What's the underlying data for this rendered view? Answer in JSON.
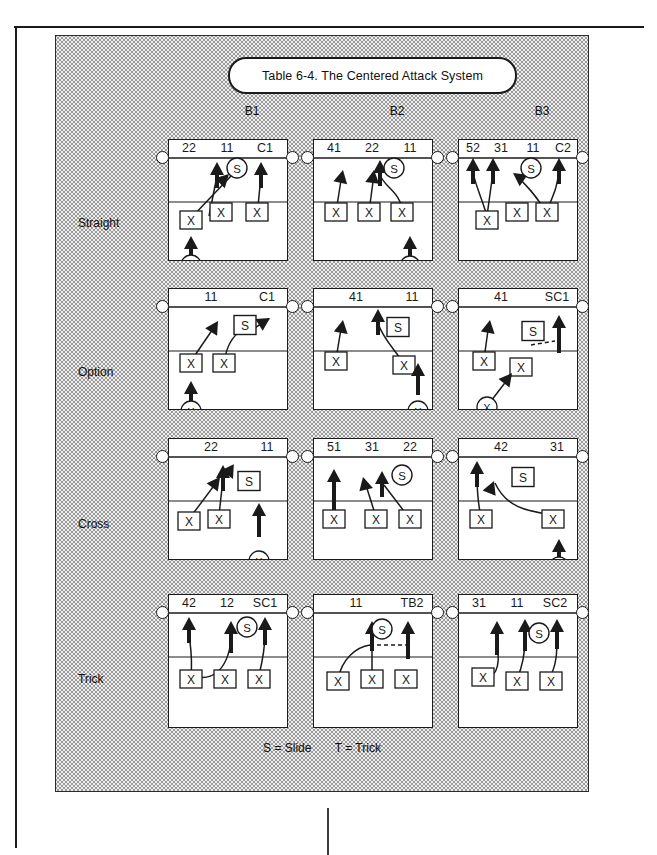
{
  "title": "Table 6-4. The Centered Attack System",
  "columns": [
    "B1",
    "B2",
    "B3"
  ],
  "rows": [
    "Straight",
    "Option",
    "Cross",
    "Trick"
  ],
  "legend": {
    "slide": "S = Slide",
    "trick": "T = Trick"
  },
  "symbols": {
    "blocker": "X",
    "back_player": "X",
    "setter": "S"
  },
  "colors": {
    "ink": "#1a1a1a",
    "paper": "#ffffff",
    "shade": "#efefef"
  },
  "cells": [
    {
      "row": "Straight",
      "col": "B1",
      "attack_labels": [
        "22",
        "11",
        "C1"
      ],
      "setter_shape": "circle",
      "front_players": 3,
      "back_player": true
    },
    {
      "row": "Straight",
      "col": "B2",
      "attack_labels": [
        "41",
        "22",
        "11"
      ],
      "setter_shape": "circle",
      "front_players": 3,
      "back_player": true
    },
    {
      "row": "Straight",
      "col": "B3",
      "attack_labels": [
        "52",
        "31",
        "11",
        "C2"
      ],
      "setter_shape": "circle",
      "front_players": 3,
      "back_player": false
    },
    {
      "row": "Option",
      "col": "B1",
      "attack_labels": [
        "11",
        "C1"
      ],
      "setter_shape": "square",
      "front_players": 2,
      "back_player": true
    },
    {
      "row": "Option",
      "col": "B2",
      "attack_labels": [
        "41",
        "11"
      ],
      "setter_shape": "square",
      "front_players": 2,
      "back_player": true
    },
    {
      "row": "Option",
      "col": "B3",
      "attack_labels": [
        "41",
        "SC1"
      ],
      "setter_shape": "square",
      "front_players": 2,
      "back_player": true
    },
    {
      "row": "Cross",
      "col": "B1",
      "attack_labels": [
        "22",
        "11"
      ],
      "setter_shape": "square",
      "front_players": 2,
      "back_player": true
    },
    {
      "row": "Cross",
      "col": "B2",
      "attack_labels": [
        "51",
        "31",
        "22"
      ],
      "setter_shape": "circle",
      "front_players": 3,
      "back_player": false
    },
    {
      "row": "Cross",
      "col": "B3",
      "attack_labels": [
        "42",
        "31"
      ],
      "setter_shape": "square",
      "front_players": 2,
      "back_player": true
    },
    {
      "row": "Trick",
      "col": "B1",
      "attack_labels": [
        "42",
        "12",
        "SC1"
      ],
      "setter_shape": "circle",
      "front_players": 3,
      "back_player": false
    },
    {
      "row": "Trick",
      "col": "B2",
      "attack_labels": [
        "11",
        "TB2"
      ],
      "setter_shape": "circle",
      "front_players": 3,
      "back_player": false
    },
    {
      "row": "Trick",
      "col": "B3",
      "attack_labels": [
        "31",
        "11",
        "SC2"
      ],
      "setter_shape": "circle",
      "front_players": 3,
      "back_player": false
    }
  ]
}
